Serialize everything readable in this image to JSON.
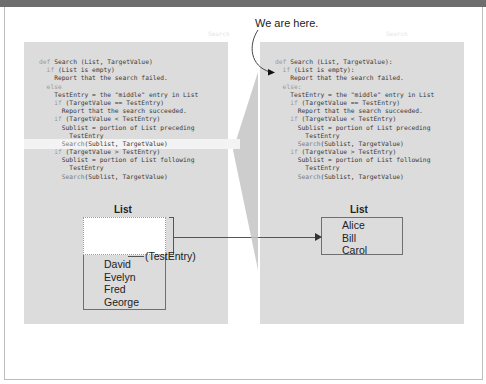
{
  "callout": {
    "text": "We are here."
  },
  "ghost_labels": {
    "left": "Search",
    "right": "Search"
  },
  "left_panel": {
    "code": [
      {
        "indent": "",
        "kw": "def ",
        "text": "Search (List, TargetValue)",
        "hl": false
      },
      {
        "indent": "  ",
        "kw": "if ",
        "text": "(List is empty)",
        "hl": false
      },
      {
        "indent": "    ",
        "kw": "",
        "text": "Report that the search failed.",
        "hl": false
      },
      {
        "indent": "  ",
        "kw": "else",
        "text": "",
        "hl": false
      },
      {
        "indent": "    ",
        "kw": "",
        "text": "TestEntry = the \"middle\" entry in List",
        "hl": false
      },
      {
        "indent": "    ",
        "kw": "if ",
        "text": "(TargetValue == TestEntry)",
        "hl": false
      },
      {
        "indent": "      ",
        "kw": "",
        "text": "Report that the search succeeded.",
        "hl": false
      },
      {
        "indent": "    ",
        "kw": "if ",
        "text": "(TargetValue < TestEntry)",
        "hl": false
      },
      {
        "indent": "      ",
        "kw": "",
        "text": "Sublist = portion of List preceding",
        "hl": false
      },
      {
        "indent": "        ",
        "kw": "",
        "text": "TestEntry",
        "hl": false
      },
      {
        "indent": "      ",
        "kw": "",
        "call": "Search",
        "text": "(Sublist, TargetValue)",
        "hl": true
      },
      {
        "indent": "    ",
        "kw": "if ",
        "text": "(TargetValue > TestEntry)",
        "hl": false
      },
      {
        "indent": "      ",
        "kw": "",
        "text": "Sublist = portion of List following",
        "hl": false
      },
      {
        "indent": "        ",
        "kw": "",
        "text": "TestEntry",
        "hl": false
      },
      {
        "indent": "      ",
        "kw": "",
        "call": "Search",
        "text": "(Sublist, TargetValue)",
        "hl": false
      }
    ],
    "list_title": "List",
    "list_items": [
      "David",
      "Evelyn",
      "Fred",
      "George"
    ],
    "test_entry_label": "(TestEntry)"
  },
  "right_panel": {
    "code": [
      {
        "indent": "",
        "kw": "def ",
        "text": "Search (List, TargetValue):",
        "hl": false
      },
      {
        "indent": "  ",
        "kw": "if ",
        "text": "(List is empty):",
        "hl": false
      },
      {
        "indent": "    ",
        "kw": "",
        "text": "Report that the search failed.",
        "hl": false
      },
      {
        "indent": "  ",
        "kw": "else:",
        "text": "",
        "hl": false
      },
      {
        "indent": "    ",
        "kw": "",
        "text": "TestEntry = the \"middle\" entry in List",
        "hl": false
      },
      {
        "indent": "    ",
        "kw": "if ",
        "text": "(TargetValue == TestEntry)",
        "hl": false
      },
      {
        "indent": "      ",
        "kw": "",
        "text": "Report that the search succeeded.",
        "hl": false
      },
      {
        "indent": "    ",
        "kw": "if ",
        "text": "(TargetValue < TestEntry)",
        "hl": false
      },
      {
        "indent": "      ",
        "kw": "",
        "text": "Sublist = portion of List preceding",
        "hl": false
      },
      {
        "indent": "        ",
        "kw": "",
        "text": "TestEntry",
        "hl": false
      },
      {
        "indent": "      ",
        "kw": "",
        "call": "Search",
        "text": "(Sublist, TargetValue)",
        "hl": false
      },
      {
        "indent": "    ",
        "kw": "if ",
        "text": "(TargetValue > TestEntry)",
        "hl": false
      },
      {
        "indent": "      ",
        "kw": "",
        "text": "Sublist = portion of List following",
        "hl": false
      },
      {
        "indent": "        ",
        "kw": "",
        "text": "TestEntry",
        "hl": false
      },
      {
        "indent": "      ",
        "kw": "",
        "call": "Search",
        "text": "(Sublist, TargetValue)",
        "hl": false
      }
    ],
    "list_title": "List",
    "list_items": [
      "Alice",
      "Bill",
      "Carol"
    ]
  },
  "colors": {
    "panel_bg": "#dcdcdc",
    "highlight": "#f3f3f3",
    "keyword": "#9a9a9a",
    "text": "#222222",
    "shadow": "#c4c4c4"
  }
}
